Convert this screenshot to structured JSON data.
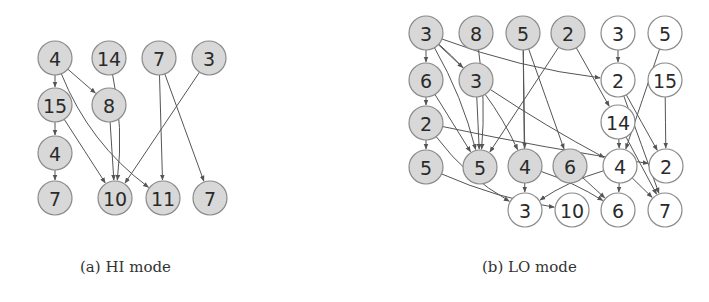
{
  "figures": [
    {
      "id": "hi",
      "caption": "(a) HI mode",
      "nodes": [
        {
          "id": "a1",
          "label": "4",
          "fill": "gray"
        },
        {
          "id": "a2",
          "label": "14",
          "fill": "gray"
        },
        {
          "id": "a3",
          "label": "7",
          "fill": "gray"
        },
        {
          "id": "a4",
          "label": "3",
          "fill": "gray"
        },
        {
          "id": "a5",
          "label": "15",
          "fill": "gray"
        },
        {
          "id": "a6",
          "label": "8",
          "fill": "gray"
        },
        {
          "id": "a7",
          "label": "4",
          "fill": "gray"
        },
        {
          "id": "a8",
          "label": "7",
          "fill": "gray"
        },
        {
          "id": "a9",
          "label": "10",
          "fill": "gray"
        },
        {
          "id": "a10",
          "label": "11",
          "fill": "gray"
        },
        {
          "id": "a11",
          "label": "7",
          "fill": "gray"
        }
      ],
      "edges": [
        [
          "a1",
          "a5"
        ],
        [
          "a1",
          "a6"
        ],
        [
          "a1",
          "a10"
        ],
        [
          "a5",
          "a7"
        ],
        [
          "a7",
          "a8"
        ],
        [
          "a5",
          "a9"
        ],
        [
          "a6",
          "a9"
        ],
        [
          "a2",
          "a9"
        ],
        [
          "a4",
          "a9"
        ],
        [
          "a3",
          "a10"
        ],
        [
          "a3",
          "a11"
        ]
      ]
    },
    {
      "id": "lo",
      "caption": "(b) LO mode",
      "nodes": [
        {
          "id": "b1",
          "label": "3",
          "fill": "gray"
        },
        {
          "id": "b2",
          "label": "8",
          "fill": "gray"
        },
        {
          "id": "b3",
          "label": "5",
          "fill": "gray"
        },
        {
          "id": "b4",
          "label": "2",
          "fill": "gray"
        },
        {
          "id": "b5",
          "label": "3",
          "fill": "white"
        },
        {
          "id": "b6",
          "label": "5",
          "fill": "white"
        },
        {
          "id": "b7",
          "label": "6",
          "fill": "gray"
        },
        {
          "id": "b8",
          "label": "3",
          "fill": "gray"
        },
        {
          "id": "b9",
          "label": "2",
          "fill": "white"
        },
        {
          "id": "b10",
          "label": "15",
          "fill": "white"
        },
        {
          "id": "b11",
          "label": "2",
          "fill": "gray"
        },
        {
          "id": "b12",
          "label": "14",
          "fill": "white"
        },
        {
          "id": "b13",
          "label": "5",
          "fill": "gray"
        },
        {
          "id": "b14",
          "label": "5",
          "fill": "gray"
        },
        {
          "id": "b15",
          "label": "4",
          "fill": "gray"
        },
        {
          "id": "b16",
          "label": "6",
          "fill": "gray"
        },
        {
          "id": "b17",
          "label": "4",
          "fill": "white"
        },
        {
          "id": "b18",
          "label": "2",
          "fill": "white"
        },
        {
          "id": "b19",
          "label": "3",
          "fill": "white"
        },
        {
          "id": "b20",
          "label": "10",
          "fill": "white"
        },
        {
          "id": "b21",
          "label": "6",
          "fill": "white"
        },
        {
          "id": "b22",
          "label": "7",
          "fill": "white"
        }
      ],
      "edges": [
        [
          "b1",
          "b7"
        ],
        [
          "b7",
          "b11"
        ],
        [
          "b11",
          "b13"
        ],
        [
          "b1",
          "b8"
        ],
        [
          "b1",
          "b9"
        ],
        [
          "b1",
          "b14"
        ],
        [
          "b1",
          "b15"
        ],
        [
          "b7",
          "b14"
        ],
        [
          "b8",
          "b14"
        ],
        [
          "b8",
          "b17"
        ],
        [
          "b2",
          "b14"
        ],
        [
          "b3",
          "b19"
        ],
        [
          "b3",
          "b15"
        ],
        [
          "b3",
          "b16"
        ],
        [
          "b4",
          "b14"
        ],
        [
          "b4",
          "b12"
        ],
        [
          "b5",
          "b9"
        ],
        [
          "b9",
          "b22"
        ],
        [
          "b6",
          "b17"
        ],
        [
          "b10",
          "b18"
        ],
        [
          "b11",
          "b18"
        ],
        [
          "b11",
          "b19"
        ],
        [
          "b12",
          "b17"
        ],
        [
          "b12",
          "b22"
        ],
        [
          "b13",
          "b20"
        ],
        [
          "b15",
          "b21"
        ],
        [
          "b16",
          "b21"
        ],
        [
          "b17",
          "b19"
        ],
        [
          "b17",
          "b21"
        ],
        [
          "b17",
          "b22"
        ],
        [
          "b9",
          "b18"
        ]
      ]
    }
  ],
  "colors": {
    "gray_fill": "#d8d8d8",
    "white_fill": "#ffffff",
    "stroke": "#8a8a8a",
    "edge": "#555555"
  }
}
